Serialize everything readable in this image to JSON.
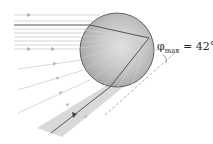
{
  "diagram": {
    "label": {
      "symbol": "φ",
      "subscript": "max",
      "equals": " = 42°"
    },
    "droplet": {
      "cx": 117,
      "cy": 50,
      "r": 37,
      "fill": "#b8b8b8",
      "stroke": "#555555"
    },
    "incoming_rays": {
      "direction": "left-to-right",
      "count": 10,
      "color": "#bdbdbd"
    },
    "highlighted_ray": {
      "color": "#555555"
    },
    "exit_beam": {
      "color": "#d6d6d6"
    },
    "reference_line": {
      "style": "dashed",
      "color": "#9a9a9a"
    }
  }
}
